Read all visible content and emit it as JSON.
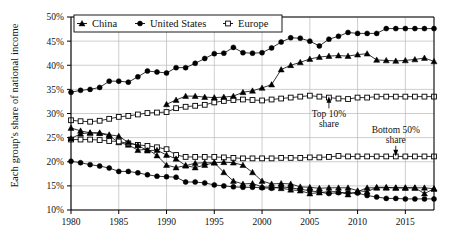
{
  "chart_data": {
    "type": "line",
    "title": "",
    "xlabel": "",
    "ylabel": "Each group's share of national income",
    "xlim": [
      1980,
      2018
    ],
    "ylim": [
      10,
      50
    ],
    "grid": true,
    "legend_position": "top-left-inside",
    "y_tick_labels": [
      "50%",
      "45%",
      "40%",
      "35%",
      "30%",
      "25%",
      "20%",
      "15%",
      "10%"
    ],
    "y_ticks": [
      50,
      45,
      40,
      35,
      30,
      25,
      20,
      15,
      10
    ],
    "x_tick_labels": [
      "1980",
      "1985",
      "1990",
      "1995",
      "2000",
      "2005",
      "2010",
      "2015"
    ],
    "x_ticks": [
      1980,
      1985,
      1990,
      1995,
      2000,
      2005,
      2010,
      2015
    ],
    "legend": [
      {
        "label": "China",
        "marker": "filled-triangle"
      },
      {
        "label": "United States",
        "marker": "filled-circle"
      },
      {
        "label": "Europe",
        "marker": "open-square"
      }
    ],
    "annotations": [
      {
        "text_line1": "Top 10%",
        "text_line2": "share",
        "x": 2007,
        "y": 29.2,
        "arrow": "up",
        "points_to": {
          "x": 2007,
          "y": 33.6
        }
      },
      {
        "text_line1": "Bottom 50%",
        "text_line2": "share",
        "x": 2014,
        "y": 26.0,
        "arrow": "down",
        "points_to": {
          "x": 2014,
          "y": 21.1
        }
      }
    ],
    "x": [
      1980,
      1981,
      1982,
      1983,
      1984,
      1985,
      1986,
      1987,
      1988,
      1989,
      1990,
      1991,
      1992,
      1993,
      1994,
      1995,
      1996,
      1997,
      1998,
      1999,
      2000,
      2001,
      2002,
      2003,
      2004,
      2005,
      2006,
      2007,
      2008,
      2009,
      2010,
      2011,
      2012,
      2013,
      2014,
      2015,
      2016,
      2017,
      2018
    ],
    "series": [
      {
        "name": "United States Top 10% share",
        "country": "United States",
        "group": "Top 10%",
        "marker": "filled-circle",
        "values": [
          34.4,
          34.8,
          35.0,
          35.4,
          36.7,
          36.7,
          36.5,
          37.6,
          38.8,
          38.6,
          38.4,
          39.5,
          39.5,
          40.4,
          41.4,
          42.4,
          42.5,
          43.7,
          42.6,
          42.5,
          42.6,
          43.6,
          44.8,
          45.7,
          45.6,
          45.0,
          44.0,
          45.4,
          46.0,
          46.8,
          46.6,
          46.6,
          46.6,
          47.6,
          47.6,
          47.6,
          47.6,
          47.6,
          47.6
        ]
      },
      {
        "name": "China Top 10% share",
        "country": "China",
        "group": "Top 10%",
        "marker": "filled-triangle",
        "values": [
          27.0,
          26.4,
          26.0,
          25.9,
          25.4,
          24.0,
          23.5,
          22.4,
          22.6,
          21.3,
          19.3,
          18.8,
          19.2,
          19.7,
          19.8,
          19.8,
          17.8,
          16.0,
          15.4,
          15.5,
          14.8,
          14.7,
          14.5,
          14.2,
          14.0,
          13.4,
          13.6,
          13.8,
          13.8,
          13.2,
          13.8,
          14.6,
          14.6,
          14.6,
          14.6,
          14.6,
          14.6,
          13.4,
          14.4
        ]
      },
      {
        "name": "Europe Top 10% share",
        "country": "Europe",
        "group": "Top 10%",
        "marker": "open-square",
        "values": [
          28.6,
          28.4,
          28.3,
          28.5,
          28.9,
          29.3,
          29.5,
          29.8,
          30.1,
          30.2,
          30.3,
          31.1,
          31.4,
          31.6,
          31.8,
          32.3,
          32.6,
          32.8,
          32.9,
          32.8,
          32.7,
          32.9,
          33.1,
          33.3,
          33.5,
          33.7,
          33.5,
          33.3,
          33.1,
          33.0,
          33.3,
          33.3,
          33.5,
          33.5,
          33.5,
          33.5,
          33.5,
          33.5,
          33.5
        ]
      },
      {
        "name": "China Bottom 50% share — rising branch (Top 10% China)",
        "country": "China",
        "group": "Top 10%",
        "marker": "filled-triangle",
        "values": [
          null,
          null,
          null,
          null,
          null,
          null,
          null,
          null,
          null,
          null,
          31.9,
          32.8,
          33.6,
          33.6,
          33.4,
          33.3,
          33.4,
          33.6,
          34.4,
          34.7,
          35.3,
          36.0,
          39.1,
          40.0,
          40.6,
          41.3,
          41.7,
          41.9,
          42.0,
          41.9,
          42.2,
          42.4,
          41.1,
          41.0,
          40.9,
          41.0,
          41.2,
          41.5,
          40.8
        ]
      },
      {
        "name": "Europe Bottom 50% share",
        "country": "Europe",
        "group": "Bottom 50%",
        "marker": "open-square",
        "values": [
          24.6,
          24.6,
          24.6,
          24.5,
          24.3,
          24.2,
          23.8,
          23.5,
          23.3,
          23.0,
          22.6,
          21.4,
          21.0,
          21.0,
          21.0,
          21.0,
          20.9,
          20.8,
          20.7,
          20.7,
          20.7,
          20.7,
          20.8,
          20.8,
          20.8,
          20.9,
          20.9,
          21.0,
          21.2,
          21.1,
          21.1,
          21.1,
          21.1,
          21.1,
          21.1,
          21.1,
          21.1,
          21.1,
          21.1
        ]
      },
      {
        "name": "United States Bottom 50% share",
        "country": "United States",
        "group": "Bottom 50%",
        "marker": "filled-circle",
        "values": [
          20.1,
          19.8,
          19.4,
          19.1,
          18.7,
          18.0,
          18.0,
          17.7,
          17.3,
          17.0,
          16.9,
          16.8,
          15.8,
          15.8,
          15.6,
          15.2,
          15.0,
          14.8,
          14.7,
          14.7,
          14.6,
          14.5,
          14.8,
          14.6,
          14.3,
          14.0,
          13.7,
          13.4,
          13.6,
          13.6,
          13.5,
          13.0,
          12.7,
          12.4,
          12.4,
          12.3,
          12.3,
          12.3,
          12.3
        ]
      },
      {
        "name": "China Bottom 50% share",
        "country": "China",
        "group": "Bottom 50%",
        "marker": "filled-triangle",
        "values": [
          24.8,
          25.8,
          26.0,
          26.0,
          25.6,
          25.3,
          24.0,
          23.4,
          22.3,
          22.4,
          21.4,
          20.6,
          19.2,
          18.8,
          19.3,
          19.8,
          19.9,
          19.8,
          19.3,
          17.8,
          16.0,
          15.4,
          15.5,
          15.4,
          14.8,
          14.7,
          14.5,
          14.6,
          14.6,
          14.6,
          14.0,
          13.8,
          14.7,
          14.7,
          14.6,
          14.6,
          14.6,
          14.6,
          14.4
        ]
      }
    ]
  }
}
